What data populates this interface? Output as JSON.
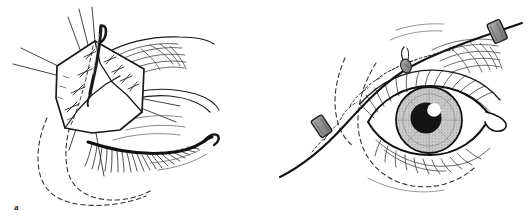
{
  "figure": {
    "background_color": "#ffffff",
    "ink_color": "#1a1a1a",
    "width": 528,
    "height": 223,
    "panel_count": 2
  },
  "panels": [
    {
      "id": "a",
      "label": "a",
      "caption": "Raised skin flap with traction sutures and retractor hook over closed eyelid",
      "elements": {
        "flap": "kite-shaped-skin-flap",
        "traction_sutures": "radiating-traction-suture-lines",
        "retractor": "curved-skin-hook-retractor",
        "suture_line": "dashed-midline-with-interrupted-sutures",
        "eye_state": "closed-eyelid-with-lashes",
        "brow": "eyebrow-hair-strokes",
        "incision_marking": "dashed-planned-incision-outline"
      }
    },
    {
      "id": "b",
      "label": "b",
      "caption": "Completed suture line with bolsters over open eye",
      "elements": {
        "suture_line": "curved-running-suture-across-brow",
        "bolsters": "two-gray-rectangular-bolsters",
        "knot": "suture-knot-tie",
        "eye_state": "open-eye-with-iris-and-pupil",
        "iris": "gray-stippled-iris",
        "pupil": "black-pupil-with-white-highlight",
        "brow": "eyebrow-hair-strokes",
        "incision_marking": "dashed-planned-incision-outline",
        "canthus": "lateral-canthus-rounded-tip"
      }
    }
  ],
  "colors": {
    "ink": "#1a1a1a",
    "line": "#222222",
    "bolster_fill": "#9a9a9a",
    "bolster_stroke": "#2a2a2a",
    "iris_fill": "#b8b8b8",
    "iris_inner": "#a0a0a0",
    "pupil": "#141414",
    "highlight": "#ffffff",
    "background": "#ffffff",
    "hair_light": "#6a6a6a"
  }
}
